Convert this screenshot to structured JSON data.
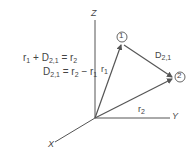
{
  "equations": {
    "line1": {
      "a": "r",
      "a_sub": "1",
      "op1": " + D",
      "b_sub": "2,1",
      "op2": " = r",
      "c_sub": "2"
    },
    "line2": {
      "a": "D",
      "a_sub": "2,1",
      "op1": " = r",
      "b_sub": "2",
      "op2": " − r",
      "c_sub": "1"
    }
  },
  "axes": {
    "z": "Z",
    "y": "Y",
    "x": "X"
  },
  "points": [
    {
      "id": "point-1",
      "label": "1"
    },
    {
      "id": "point-2",
      "label": "2"
    }
  ],
  "vectors": {
    "r1": {
      "base": "r",
      "sub": "1"
    },
    "r2": {
      "base": "r",
      "sub": "2"
    },
    "d21": {
      "base": "D",
      "sub": "2,1"
    }
  },
  "colors": {
    "line": "#555555",
    "text": "#444444"
  }
}
